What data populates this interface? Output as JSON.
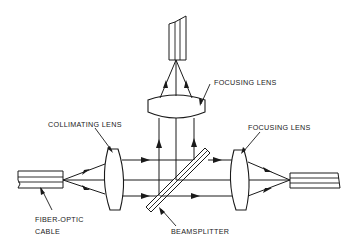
{
  "diagram": {
    "type": "optical-schematic",
    "labels": {
      "collimating_lens": "COLLIMATING LENS",
      "focusing_lens_top": "FOCUSING LENS",
      "focusing_lens_right": "FOCUSING LENS",
      "fiber_optic_cable_line1": "FIBER-OPTIC",
      "fiber_optic_cable_line2": "CABLE",
      "beamsplitter": "BEAMSPLITTER"
    },
    "components": [
      {
        "id": "input-fiber",
        "name": "Fiber-optic cable (input)"
      },
      {
        "id": "collimating-lens",
        "name": "Collimating lens"
      },
      {
        "id": "beamsplitter",
        "name": "Beamsplitter"
      },
      {
        "id": "focusing-lens-top",
        "name": "Focusing lens (reflected path)"
      },
      {
        "id": "output-fiber-top",
        "name": "Output fiber (reflected path)"
      },
      {
        "id": "focusing-lens-right",
        "name": "Focusing lens (transmitted path)"
      },
      {
        "id": "output-fiber-right",
        "name": "Output fiber (transmitted path)"
      }
    ],
    "colors": {
      "line": "#1a1a1a",
      "background": "#ffffff"
    }
  }
}
